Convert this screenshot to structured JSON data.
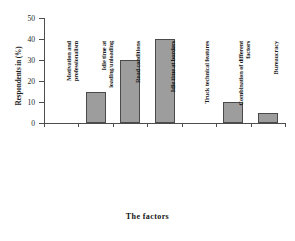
{
  "chart_data": {
    "type": "bar",
    "title": "",
    "xlabel": "The factors",
    "ylabel": "Respondents in (%)",
    "categories": [
      "Motivation and professionalism",
      "Idle time at loading/unloading",
      "Road conditions",
      "Idle time at borders",
      "Truck technical features",
      "Combination of different factors",
      "Bureaucracy"
    ],
    "category_lines": [
      [
        "Motivation and",
        "professionalism"
      ],
      [
        "Idle time at",
        "loading/unloading"
      ],
      [
        "Road conditions"
      ],
      [
        "Idle time at borders"
      ],
      [
        "Truck technical features"
      ],
      [
        "Combination of different",
        "factors"
      ],
      [
        "Bureaucracy"
      ]
    ],
    "values": [
      0,
      15,
      30,
      40,
      0,
      10,
      5
    ],
    "ylim": [
      0,
      50
    ],
    "yticks": [
      0,
      10,
      20,
      30,
      40,
      50
    ],
    "ytick_labels": [
      "0",
      "10",
      "20",
      "30",
      "40",
      "50"
    ],
    "grid": false,
    "legend": null,
    "bar_color": "#9d9d9d",
    "bar_edge_color": "#4a4a4a",
    "axis_color": "#4d4d4d"
  }
}
